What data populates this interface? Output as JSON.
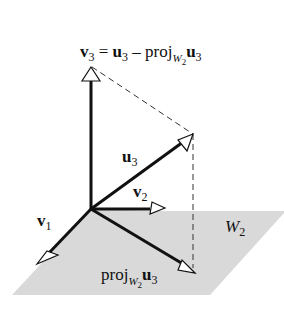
{
  "diagram": {
    "title_equation": {
      "v": "v",
      "v_sub": "3",
      "eq": " = ",
      "u": "u",
      "u_sub": "3",
      "minus": " – proj",
      "proj_sub": "W",
      "proj_subsub": "2",
      "u2": "u",
      "u2_sub": "3"
    },
    "labels": {
      "u3": {
        "main": "u",
        "sub": "3"
      },
      "v2": {
        "main": "v",
        "sub": "2"
      },
      "v1": {
        "main": "v",
        "sub": "1"
      },
      "plane": {
        "main": "W",
        "sub": "2"
      },
      "proj": {
        "main": "proj",
        "sub": "W",
        "subsub": "2",
        "vec": "u",
        "vec_sub": "3"
      }
    },
    "colors": {
      "plane": "#d9d9d9",
      "line": "#111111",
      "dash": "#333333"
    }
  }
}
